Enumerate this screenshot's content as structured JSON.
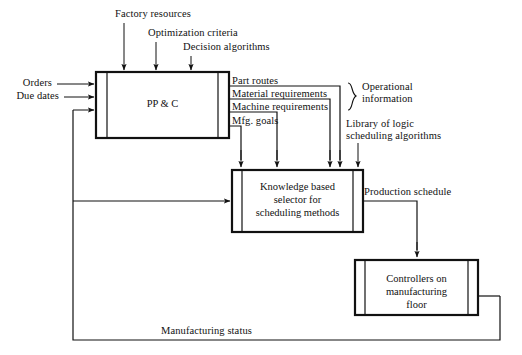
{
  "diagram": {
    "type": "block-flow-diagram",
    "colors": {
      "line": "#111111",
      "text": "#111111",
      "background": "#ffffff"
    },
    "boxes": [
      {
        "id": "ppc",
        "label": "PP & C",
        "x": 96,
        "y": 72,
        "w": 133,
        "h": 66
      },
      {
        "id": "knowledge-selector",
        "label": "Knowledge based\nselector for\nscheduling methods",
        "x": 232,
        "y": 170,
        "w": 131,
        "h": 62
      },
      {
        "id": "controllers",
        "label": "Controllers on\nmanufacturing\nfloor",
        "x": 355,
        "y": 260,
        "w": 123,
        "h": 55
      }
    ],
    "top_inputs": [
      {
        "label": "Factory resources",
        "arrow_x": 124
      },
      {
        "label": "Optimization criteria",
        "arrow_x": 156
      },
      {
        "label": "Decision algorithms",
        "arrow_x": 191
      }
    ],
    "left_inputs": [
      {
        "label": "Orders"
      },
      {
        "label": "Due dates"
      }
    ],
    "outputs": [
      {
        "label": "Part routes"
      },
      {
        "label": "Material requirements"
      },
      {
        "label": "Machine requirements"
      },
      {
        "label": "Mfg. goals"
      }
    ],
    "group_labels": [
      {
        "id": "operational",
        "label": "Operational\ninformation"
      },
      {
        "id": "library",
        "label": "Library of logic\nscheduling algorithms"
      }
    ],
    "flow_labels": [
      {
        "id": "production-schedule",
        "label": "Production schedule"
      },
      {
        "id": "manufacturing-status",
        "label": "Manufacturing status"
      }
    ]
  }
}
